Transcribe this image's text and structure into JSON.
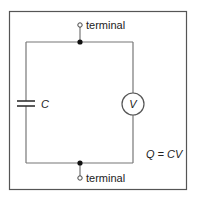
{
  "diagram": {
    "type": "circuit",
    "components": {
      "top_terminal": {
        "label": "terminal"
      },
      "bottom_terminal": {
        "label": "terminal"
      },
      "capacitor": {
        "label": "C"
      },
      "voltmeter": {
        "label": "V"
      }
    },
    "equation": "Q = CV",
    "colors": {
      "frame": "#555555",
      "wire": "#666666",
      "text": "#222222"
    }
  }
}
